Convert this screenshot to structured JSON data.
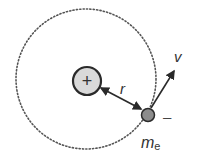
{
  "diagram": {
    "type": "bohr-atom-orbit",
    "nucleus": {
      "symbol": "+",
      "fill": "#d9d9d9",
      "stroke": "#2a2a2a"
    },
    "electron": {
      "fill": "#8c8c8c",
      "stroke": "#2a2a2a",
      "charge_label": "–",
      "mass_label": "m",
      "mass_subscript": "e"
    },
    "radius_label": "r",
    "velocity_label": "v",
    "orbit": {
      "style": "dotted",
      "color": "#555555"
    }
  }
}
